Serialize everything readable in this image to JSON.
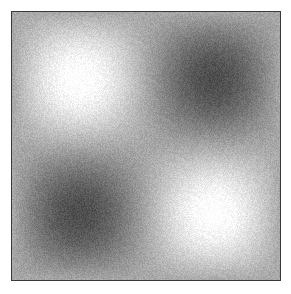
{
  "image": {
    "description": "Grayscale noisy texture with two bright blobs and two dark blobs in a checkerboard arrangement",
    "background_color": "#a8a8a8",
    "border_color": "#3a3a3a",
    "blobs": [
      {
        "name": "bright-top-left",
        "cx": 0.25,
        "cy": 0.25,
        "tone": "light"
      },
      {
        "name": "dark-top-right",
        "cx": 0.75,
        "cy": 0.25,
        "tone": "dark"
      },
      {
        "name": "dark-bottom-left",
        "cx": 0.25,
        "cy": 0.75,
        "tone": "dark"
      },
      {
        "name": "bright-bottom-right",
        "cx": 0.75,
        "cy": 0.75,
        "tone": "light"
      }
    ]
  }
}
